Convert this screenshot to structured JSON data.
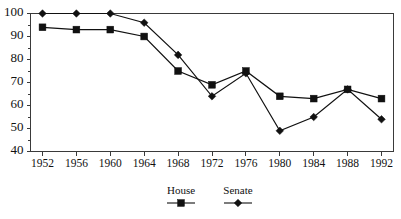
{
  "chart_data": {
    "type": "line",
    "title": "",
    "subtitle": "",
    "xlabel": "",
    "ylabel": "",
    "categories": [
      "1952",
      "1956",
      "1960",
      "1964",
      "1968",
      "1972",
      "1976",
      "1980",
      "1984",
      "1988",
      "1992"
    ],
    "x": [
      1952,
      1956,
      1960,
      1964,
      1968,
      1972,
      1976,
      1980,
      1984,
      1988,
      1992
    ],
    "xlim": [
      1950,
      1994
    ],
    "ylim": [
      40,
      100
    ],
    "ytick_labels": [
      "40",
      "50",
      "60",
      "70",
      "80",
      "90",
      "100"
    ],
    "yticks": [
      40,
      50,
      60,
      70,
      80,
      90,
      100
    ],
    "grid": false,
    "legend_position": "bottom-center",
    "series": [
      {
        "name": "House",
        "marker": "square",
        "color": "#111111",
        "values": [
          94,
          93,
          93,
          90,
          75,
          69,
          75,
          64,
          63,
          67,
          63
        ]
      },
      {
        "name": "Senate",
        "marker": "diamond",
        "color": "#111111",
        "values": [
          100,
          100,
          100,
          96,
          82,
          64,
          74,
          49,
          55,
          67,
          54
        ]
      }
    ]
  },
  "legend": {
    "entries": [
      {
        "label": "House",
        "marker": "square"
      },
      {
        "label": "Senate",
        "marker": "diamond"
      }
    ]
  },
  "colors": {
    "axis": "#3a3a3a",
    "ink": "#111111",
    "background": "#ffffff"
  }
}
